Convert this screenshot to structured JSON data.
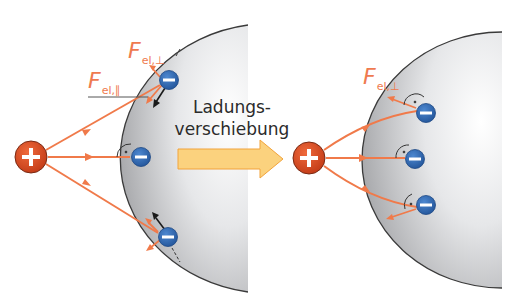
{
  "colors": {
    "field_line": "#f07a4a",
    "positive_charge": "#d9471f",
    "negative_charge": "#2f6bb5",
    "sphere_light": "#f7f7f7",
    "sphere_dark": "#a9aaad",
    "arrow_fill": "#fbd27e",
    "arrow_stroke": "#f2a33a",
    "label_color": "#ef7a4f",
    "force_arrow": "#1a1a1a"
  },
  "left_panel": {
    "label_perp": {
      "symbol": "F",
      "subscript": "el,⊥"
    },
    "label_parallel": {
      "symbol": "F",
      "subscript": "el,∥"
    },
    "positive_charge_symbol": "+",
    "negative_charge_symbol": "−",
    "electron_count": 3
  },
  "center": {
    "caption_line1": "Ladungs-",
    "caption_line2": "verschiebung"
  },
  "right_panel": {
    "label_perp": {
      "symbol": "F",
      "subscript": "el,⊥"
    },
    "positive_charge_symbol": "+",
    "negative_charge_symbol": "−",
    "electron_count": 3
  }
}
